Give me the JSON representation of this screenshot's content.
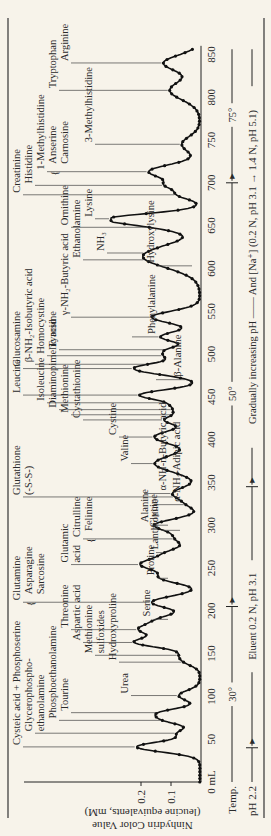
{
  "chart_data": {
    "type": "line",
    "title": "",
    "xlabel": "Effluent volume (mL)",
    "ylabel": "Ninhydrin Color Value (leucine equivalents, mM)",
    "ylabel_line1": "Ninhydrin Color Value",
    "ylabel_line2": "(leucine equivalents, mM)",
    "xlim": [
      0,
      860
    ],
    "ylim": [
      0,
      0.3
    ],
    "x_ticks": [
      {
        "v": 0,
        "label": "0 mL"
      },
      {
        "v": 50,
        "label": "50"
      },
      {
        "v": 100,
        "label": "100"
      },
      {
        "v": 150,
        "label": "150"
      },
      {
        "v": 200,
        "label": "200"
      },
      {
        "v": 250,
        "label": "250"
      },
      {
        "v": 300,
        "label": "300"
      },
      {
        "v": 350,
        "label": "350"
      },
      {
        "v": 400,
        "label": "400"
      },
      {
        "v": 450,
        "label": "450"
      },
      {
        "v": 500,
        "label": "500"
      },
      {
        "v": 550,
        "label": "550"
      },
      {
        "v": 600,
        "label": "600"
      },
      {
        "v": 650,
        "label": "650"
      },
      {
        "v": 700,
        "label": "700"
      },
      {
        "v": 750,
        "label": "750"
      },
      {
        "v": 800,
        "label": "800"
      },
      {
        "v": 850,
        "label": "850"
      }
    ],
    "y_ticks": [
      {
        "v": 0.1,
        "label": "0.1"
      },
      {
        "v": 0.2,
        "label": "0.2"
      }
    ],
    "peaks": [
      {
        "x": 41,
        "h": 0.21,
        "w": 6
      },
      {
        "x": 57,
        "h": 0.07,
        "w": 5
      },
      {
        "x": 72,
        "h": 0.1,
        "w": 5
      },
      {
        "x": 81,
        "h": 0.12,
        "w": 5
      },
      {
        "x": 101,
        "h": 0.07,
        "w": 6
      },
      {
        "x": 140,
        "h": 0.04,
        "w": 5
      },
      {
        "x": 148,
        "h": 0.05,
        "w": 5
      },
      {
        "x": 163,
        "h": 0.21,
        "w": 6
      },
      {
        "x": 178,
        "h": 0.18,
        "w": 6
      },
      {
        "x": 190,
        "h": 0.12,
        "w": 6
      },
      {
        "x": 210,
        "h": 0.16,
        "w": 7
      },
      {
        "x": 238,
        "h": 0.12,
        "w": 6
      },
      {
        "x": 254,
        "h": 0.19,
        "w": 7
      },
      {
        "x": 268,
        "h": 0.09,
        "w": 6
      },
      {
        "x": 284,
        "h": 0.07,
        "w": 6
      },
      {
        "x": 300,
        "h": 0.15,
        "w": 7
      },
      {
        "x": 324,
        "h": 0.03,
        "w": 5
      },
      {
        "x": 337,
        "h": 0.09,
        "w": 7
      },
      {
        "x": 372,
        "h": 0.15,
        "w": 10
      },
      {
        "x": 403,
        "h": 0.15,
        "w": 8
      },
      {
        "x": 423,
        "h": 0.11,
        "w": 5
      },
      {
        "x": 433,
        "h": 0.06,
        "w": 4
      },
      {
        "x": 440,
        "h": 0.06,
        "w": 4
      },
      {
        "x": 452,
        "h": 0.2,
        "w": 6
      },
      {
        "x": 483,
        "h": 0.22,
        "w": 7
      },
      {
        "x": 498,
        "h": 0.08,
        "w": 4
      },
      {
        "x": 505,
        "h": 0.09,
        "w": 4
      },
      {
        "x": 520,
        "h": 0.13,
        "w": 6
      },
      {
        "x": 543,
        "h": 0.16,
        "w": 7
      },
      {
        "x": 614,
        "h": 0.19,
        "w": 13
      },
      {
        "x": 648,
        "h": 0.09,
        "w": 6
      },
      {
        "x": 658,
        "h": 0.29,
        "w": 6
      },
      {
        "x": 686,
        "h": 0.07,
        "w": 5
      },
      {
        "x": 697,
        "h": 0.09,
        "w": 5
      },
      {
        "x": 713,
        "h": 0.17,
        "w": 8
      },
      {
        "x": 745,
        "h": 0.06,
        "w": 9
      },
      {
        "x": 808,
        "h": 0.1,
        "w": 11
      },
      {
        "x": 840,
        "h": 0.12,
        "w": 9
      }
    ],
    "annotations": [
      {
        "x": 41,
        "text": "Cysteic acid + Phosphoserine",
        "row": 0
      },
      {
        "x": 57,
        "text": "Glycerophospho-",
        "row": 1,
        "text2": "ethanolamine"
      },
      {
        "x": 72,
        "text": "Phosphoethanolamine",
        "row": 3
      },
      {
        "x": 81,
        "text": "Tourine",
        "row": 4
      },
      {
        "x": 101,
        "text": "Urea",
        "row": 9
      },
      {
        "x": 140,
        "text": "Hydroxyproline",
        "row": 8
      },
      {
        "x": 148,
        "text": "Methionine",
        "row": 6,
        "text2": "sulfoxides"
      },
      {
        "x": 163,
        "text": "Aspartic acid",
        "row": 5
      },
      {
        "x": 178,
        "text": "Threonine",
        "row": 4
      },
      {
        "x": 190,
        "text": "Serine",
        "row": 11,
        "inverted": true
      },
      {
        "x": 210,
        "text": "Glutamine",
        "row": 0,
        "text2": "Asparagine",
        "text3": "Sarcosine",
        "brace": true
      },
      {
        "x": 238,
        "text": "Proline",
        "row": 11,
        "inverted": true
      },
      {
        "x": 254,
        "text": "Glutamic",
        "row": 4,
        "text2": "acid"
      },
      {
        "x": 268,
        "text": "Lanthionine",
        "row": 10,
        "inverted": true
      },
      {
        "x": 284,
        "text": "Citrulline",
        "row": 5,
        "text2": "Felinine",
        "brace": true
      },
      {
        "x": 294,
        "text": "Glycine",
        "row": 12,
        "inverted": true
      },
      {
        "x": 300,
        "text": "Alanine",
        "row": 11,
        "inverted": true
      },
      {
        "x": 324,
        "text": "α-NH₂-Adipic acid",
        "row": 10,
        "inverted": true
      },
      {
        "x": 333,
        "text": "Glutathione",
        "row": 0,
        "text2": "(-S-S-)"
      },
      {
        "x": 337,
        "text": "α-NH-n-Butyric acid",
        "row": 9,
        "inverted": true
      },
      {
        "x": 372,
        "text": "Valine",
        "row": 9
      },
      {
        "x": 403,
        "text": "Cystine",
        "row": 8
      },
      {
        "x": 423,
        "text": "Cystathionine",
        "row": 5
      },
      {
        "x": 429,
        "text": "Methionine",
        "row": 4
      },
      {
        "x": 435,
        "text": "Diaminopimelic acid",
        "row": 3
      },
      {
        "x": 443,
        "text": "Isoleucine",
        "row": 2
      },
      {
        "x": 452,
        "text": "Leucine",
        "row": 0
      },
      {
        "x": 470,
        "text": "β-Alanine",
        "row": 10,
        "inverted": true
      },
      {
        "x": 483,
        "text": "Glucosamine",
        "row": 0
      },
      {
        "x": 488,
        "text": "β-NH₂-Isobutyric acid",
        "row": 1
      },
      {
        "x": 498,
        "text": "Homocystine",
        "row": 2
      },
      {
        "x": 505,
        "text": "Tyrosine",
        "row": 3
      },
      {
        "x": 520,
        "text": "Phenylalanine",
        "row": 8,
        "inverted": true
      },
      {
        "x": 543,
        "text": "γ-NH₂-Butyric acid",
        "row": 4
      },
      {
        "x": 603,
        "text": "Hydroxylysine",
        "row": 13,
        "inverted": true
      },
      {
        "x": 610,
        "text": "Ethanolamine",
        "row": 5
      },
      {
        "x": 618,
        "text": "NH₃",
        "row": 7
      },
      {
        "x": 648,
        "text": "Ornithine",
        "row": 4
      },
      {
        "x": 658,
        "text": "Lysine",
        "row": 6
      },
      {
        "x": 686,
        "text": "Creatinine",
        "row": 0
      },
      {
        "x": 697,
        "text": "Histidine",
        "row": 1
      },
      {
        "x": 713,
        "text": "1-Methylhistidine",
        "row": 2,
        "text2": "Anserine",
        "text3": "Carnosine",
        "brace": true
      },
      {
        "x": 745,
        "text": "3-Methylhistidine",
        "row": 6
      },
      {
        "x": 808,
        "text": "Tryptophan",
        "row": 3
      },
      {
        "x": 840,
        "text": "Arginine",
        "row": 4
      }
    ],
    "conditions": {
      "temp": {
        "label": "Temp.",
        "segments": [
          {
            "from": 0,
            "to": 205,
            "label": "30°"
          },
          {
            "from": 205,
            "to": 700,
            "label": "50°"
          },
          {
            "from": 700,
            "to": 860,
            "label": "75°"
          }
        ]
      },
      "ph": {
        "label": "pH 2.2",
        "segments": [
          {
            "from": 0,
            "to": 40,
            "label": ""
          },
          {
            "from": 40,
            "to": 345,
            "label": "Eluent 0.2 N, pH 3.1"
          },
          {
            "from": 345,
            "to": 860,
            "label": "Gradually increasing pH —— And [Na⁺] (0.2 N, pH 3.1 → 1.4 N, pH 5.1)"
          }
        ]
      }
    }
  }
}
